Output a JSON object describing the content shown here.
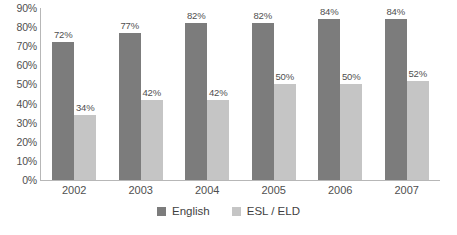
{
  "chart_data": {
    "type": "bar",
    "title": "",
    "subtitle": "",
    "xlabel": "",
    "ylabel": "",
    "categories": [
      "2002",
      "2003",
      "2004",
      "2005",
      "2006",
      "2007"
    ],
    "series": [
      {
        "name": "English",
        "color": "#7c7c7c",
        "values": [
          72,
          77,
          82,
          82,
          84,
          84
        ],
        "labels": [
          "72%",
          "77%",
          "82%",
          "82%",
          "84%",
          "84%"
        ]
      },
      {
        "name": "ESL / ELD",
        "color": "#c5c5c5",
        "values": [
          34,
          42,
          42,
          50,
          50,
          52
        ],
        "labels": [
          "34%",
          "42%",
          "42%",
          "50%",
          "50%",
          "52%"
        ]
      }
    ],
    "ylim": [
      0,
      90
    ],
    "ytick_labels": [
      "90%",
      "80%",
      "70%",
      "60%",
      "50%",
      "40%",
      "30%",
      "20%",
      "10%",
      "0%"
    ],
    "ytick_values": [
      90,
      80,
      70,
      60,
      50,
      40,
      30,
      20,
      10,
      0
    ],
    "grid": false,
    "legend_position": "bottom"
  },
  "legend": {
    "items": [
      {
        "label": "English",
        "color": "#7c7c7c"
      },
      {
        "label": "ESL / ELD",
        "color": "#c5c5c5"
      }
    ]
  },
  "axis": {
    "y_labels": [
      "90%",
      "80%",
      "70%",
      "60%",
      "50%",
      "40%",
      "30%",
      "20%",
      "10%",
      "0%"
    ],
    "x_labels": [
      "2002",
      "2003",
      "2004",
      "2005",
      "2006",
      "2007"
    ]
  }
}
